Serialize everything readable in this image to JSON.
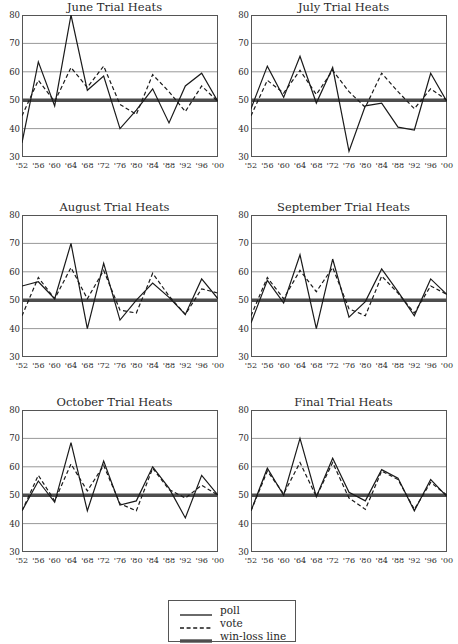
{
  "figure": {
    "y_axis": {
      "min": 30,
      "max": 80,
      "ticks": [
        30,
        40,
        50,
        60,
        70,
        80
      ]
    },
    "x_axis": {
      "tick_labels": [
        "'52",
        "'56",
        "'60",
        "'64",
        "'68",
        "'72",
        "'76",
        "'80",
        "'84",
        "'88",
        "'92",
        "'96",
        "'00"
      ]
    },
    "colors": {
      "poll_line": "#1a1a1a",
      "vote_line": "#1a1a1a",
      "winloss_line": "#4d4d4d",
      "gridline": "#999999",
      "axis": "#555555",
      "text": "#2b2b2b"
    }
  },
  "legend": {
    "items": [
      {
        "label": "poll",
        "style": "solid",
        "icon": "solid-line-icon"
      },
      {
        "label": "vote",
        "style": "dashed",
        "icon": "dashed-line-icon"
      },
      {
        "label": "win-loss line",
        "style": "thick",
        "icon": "thick-line-icon"
      }
    ]
  },
  "chart_data": [
    {
      "type": "line",
      "title": "June Trial Heats",
      "xlabel": "",
      "ylabel": "",
      "ylim": [
        30,
        80
      ],
      "grid": true,
      "legend_position": "below-figure",
      "categories": [
        "'52",
        "'56",
        "'60",
        "'64",
        "'68",
        "'72",
        "'76",
        "'80",
        "'84",
        "'88",
        "'92",
        "'96",
        "'00"
      ],
      "series": [
        {
          "name": "poll",
          "values": [
            35,
            63.5,
            48,
            80,
            53.5,
            58.5,
            40,
            46.5,
            54,
            42,
            55,
            59.5,
            49.5
          ]
        },
        {
          "name": "vote",
          "values": [
            44.5,
            57,
            49.5,
            61.5,
            54.5,
            62,
            48.5,
            45,
            59,
            53,
            46,
            55,
            49.5
          ]
        },
        {
          "name": "win-loss line",
          "values": [
            50,
            50,
            50,
            50,
            50,
            50,
            50,
            50,
            50,
            50,
            50,
            50,
            50
          ]
        }
      ]
    },
    {
      "type": "line",
      "title": "July Trial Heats",
      "xlabel": "",
      "ylabel": "",
      "ylim": [
        30,
        80
      ],
      "grid": true,
      "legend_position": "below-figure",
      "categories": [
        "'52",
        "'56",
        "'60",
        "'64",
        "'68",
        "'72",
        "'76",
        "'80",
        "'84",
        "'88",
        "'92",
        "'96",
        "'00"
      ],
      "series": [
        {
          "name": "poll",
          "values": [
            47,
            62,
            51,
            65.5,
            49,
            61.5,
            32,
            48,
            49,
            40.5,
            39.5,
            59.5,
            49.5
          ]
        },
        {
          "name": "vote",
          "values": [
            44.5,
            57,
            52.5,
            60.5,
            52,
            60.5,
            53,
            47.5,
            59.5,
            53,
            47,
            54,
            50
          ]
        },
        {
          "name": "win-loss line",
          "values": [
            50,
            50,
            50,
            50,
            50,
            50,
            50,
            50,
            50,
            50,
            50,
            50,
            50
          ]
        }
      ]
    },
    {
      "type": "line",
      "title": "August Trial Heats",
      "xlabel": "",
      "ylabel": "",
      "ylim": [
        30,
        80
      ],
      "grid": true,
      "legend_position": "below-figure",
      "categories": [
        "'52",
        "'56",
        "'60",
        "'64",
        "'68",
        "'72",
        "'76",
        "'80",
        "'84",
        "'88",
        "'92",
        "'96",
        "'00"
      ],
      "series": [
        {
          "name": "poll",
          "values": [
            55,
            56.5,
            50.5,
            70,
            40,
            63,
            43,
            50,
            56,
            51,
            45,
            57.5,
            50.5
          ]
        },
        {
          "name": "vote",
          "values": [
            44.5,
            58,
            50.5,
            61.5,
            50.5,
            60.5,
            46.5,
            45.5,
            59.5,
            51.5,
            45,
            54,
            52.5
          ]
        },
        {
          "name": "win-loss line",
          "values": [
            50,
            50,
            50,
            50,
            50,
            50,
            50,
            50,
            50,
            50,
            50,
            50,
            50
          ]
        }
      ]
    },
    {
      "type": "line",
      "title": "September Trial Heats",
      "xlabel": "",
      "ylabel": "",
      "ylim": [
        30,
        80
      ],
      "grid": true,
      "legend_position": "below-figure",
      "categories": [
        "'52",
        "'56",
        "'60",
        "'64",
        "'68",
        "'72",
        "'76",
        "'80",
        "'84",
        "'88",
        "'92",
        "'96",
        "'00"
      ],
      "series": [
        {
          "name": "poll",
          "values": [
            42,
            57,
            49,
            66,
            40,
            64.5,
            44,
            49.5,
            61,
            53,
            44.5,
            57.5,
            52
          ]
        },
        {
          "name": "vote",
          "values": [
            44.5,
            58,
            50.5,
            60.5,
            53,
            61.5,
            47,
            44.5,
            58.5,
            52.5,
            45.5,
            55,
            52
          ]
        },
        {
          "name": "win-loss line",
          "values": [
            50,
            50,
            50,
            50,
            50,
            50,
            50,
            50,
            50,
            50,
            50,
            50,
            50
          ]
        }
      ]
    },
    {
      "type": "line",
      "title": "October Trial Heats",
      "xlabel": "",
      "ylabel": "",
      "ylim": [
        30,
        80
      ],
      "grid": true,
      "legend_position": "below-figure",
      "categories": [
        "'52",
        "'56",
        "'60",
        "'64",
        "'68",
        "'72",
        "'76",
        "'80",
        "'84",
        "'88",
        "'92",
        "'96",
        "'00"
      ],
      "series": [
        {
          "name": "poll",
          "values": [
            44.5,
            55,
            47.5,
            68.5,
            44.5,
            62,
            46.5,
            48,
            60,
            52.5,
            42,
            57,
            50
          ]
        },
        {
          "name": "vote",
          "values": [
            44.5,
            57,
            48,
            61,
            51.5,
            60.5,
            47,
            44.5,
            59.5,
            52,
            49,
            53.5,
            50
          ]
        },
        {
          "name": "win-loss line",
          "values": [
            50,
            50,
            50,
            50,
            50,
            50,
            50,
            50,
            50,
            50,
            50,
            50,
            50
          ]
        }
      ]
    },
    {
      "type": "line",
      "title": "Final Trial Heats",
      "xlabel": "",
      "ylabel": "",
      "ylim": [
        30,
        80
      ],
      "grid": true,
      "legend_position": "below-figure",
      "categories": [
        "'52",
        "'56",
        "'60",
        "'64",
        "'68",
        "'72",
        "'76",
        "'80",
        "'84",
        "'88",
        "'92",
        "'96",
        "'00"
      ],
      "series": [
        {
          "name": "poll",
          "values": [
            44.5,
            59.5,
            50,
            70,
            49.5,
            63,
            51,
            48,
            59,
            56,
            44.5,
            55.5,
            49.5
          ]
        },
        {
          "name": "vote",
          "values": [
            44.5,
            58.5,
            50.5,
            61.5,
            49.5,
            61.5,
            49,
            45,
            58.5,
            55.5,
            45,
            54.5,
            50
          ]
        },
        {
          "name": "win-loss line",
          "values": [
            50,
            50,
            50,
            50,
            50,
            50,
            50,
            50,
            50,
            50,
            50,
            50,
            50
          ]
        }
      ]
    }
  ]
}
